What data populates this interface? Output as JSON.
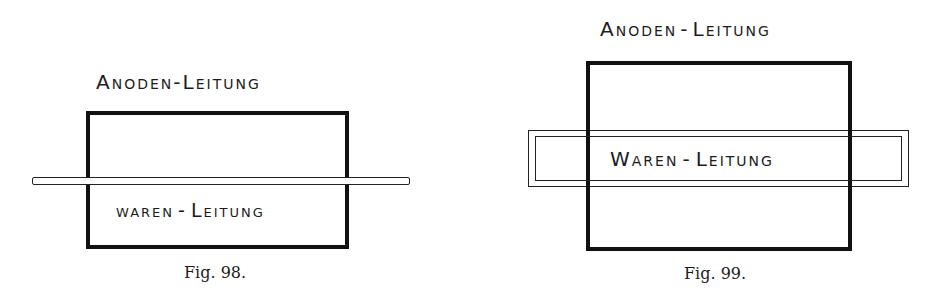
{
  "figures": [
    {
      "id": "fig98",
      "caption": "Fig. 98.",
      "anode_label": "Anoden-Leitung",
      "anode_label_parts": {
        "first_cap": "A",
        "first_rest": "noden",
        "dash": "-",
        "second_cap": "L",
        "second_rest": "eitung"
      },
      "ware_label": "Waren-Leitung",
      "ware_label_parts": {
        "first": "waren",
        "dash": "-",
        "second_cap": "L",
        "second_rest": "eitung"
      },
      "description": "Rectangular anode conductor box with a thin bar (goods conductor) crossing horizontally through it"
    },
    {
      "id": "fig99",
      "caption": "Fig. 99.",
      "anode_label": "Anoden-Leitung",
      "anode_label_parts": {
        "first_cap": "A",
        "first_rest": "noden",
        "dash": "-",
        "second_cap": "L",
        "second_rest": "eitung"
      },
      "ware_label": "Waren-Leitung",
      "ware_label_parts": {
        "first_cap": "W",
        "first_rest": "aren",
        "dash": "-",
        "second_cap": "L",
        "second_rest": "eitung"
      },
      "description": "Tall anode conductor box with a wide double-outlined frame (goods conductor) crossing horizontally through its middle"
    }
  ]
}
